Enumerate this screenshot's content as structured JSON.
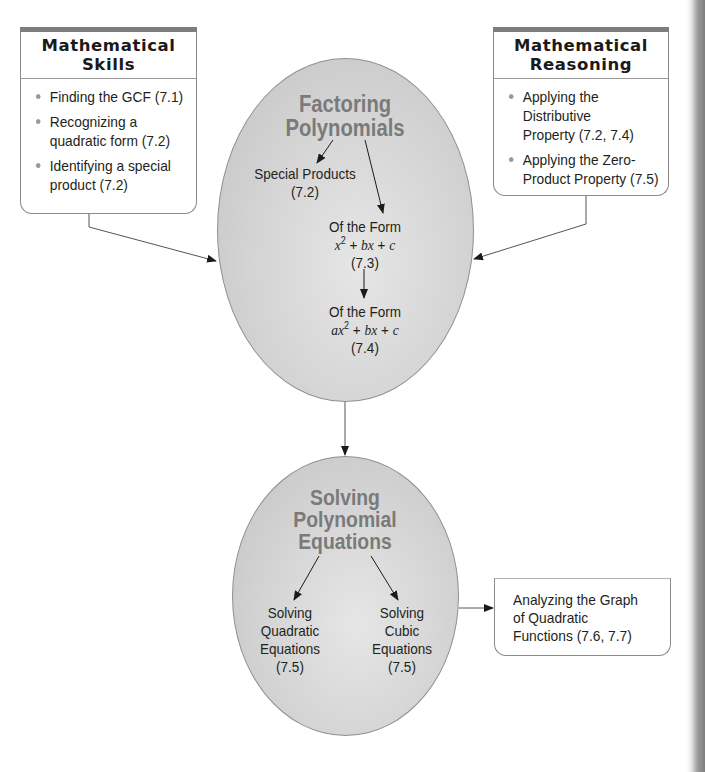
{
  "skills_box": {
    "title_line1": "Mathematical",
    "title_line2": "Skills",
    "items": [
      {
        "line1": "Finding the GCF (7.1)",
        "line2": ""
      },
      {
        "line1": "Recognizing a",
        "line2": "quadratic form (7.2)"
      },
      {
        "line1": "Identifying a special",
        "line2": "product (7.2)"
      }
    ]
  },
  "reasoning_box": {
    "title_line1": "Mathematical",
    "title_line2": "Reasoning",
    "items": [
      {
        "line1": "Applying the",
        "line2": "Distributive",
        "line3": "Property (7.2, 7.4)"
      },
      {
        "line1": "Applying the Zero-",
        "line2": "Product Property (7.5)",
        "line3": ""
      }
    ]
  },
  "factoring": {
    "title_line1": "Factoring",
    "title_line2": "Polynomials",
    "special_products": {
      "label": "Special Products",
      "section": "(7.2)"
    },
    "form1": {
      "label": "Of the Form",
      "expr_a": "x",
      "exp": "2",
      "expr_b": " + ",
      "expr_c": "bx",
      "expr_d": " + ",
      "expr_e": "c",
      "section": "(7.3)"
    },
    "form2": {
      "label": "Of the Form",
      "expr_a": "ax",
      "exp": "2",
      "expr_b": " + ",
      "expr_c": "bx",
      "expr_d": " + ",
      "expr_e": "c",
      "section": "(7.4)"
    }
  },
  "solving": {
    "title_line1": "Solving",
    "title_line2": "Polynomial",
    "title_line3": "Equations",
    "quadratic": {
      "line1": "Solving",
      "line2": "Quadratic",
      "line3": "Equations",
      "section": "(7.5)"
    },
    "cubic": {
      "line1": "Solving",
      "line2": "Cubic",
      "line3": "Equations",
      "section": "(7.5)"
    }
  },
  "graph_box": {
    "line1": "Analyzing the Graph",
    "line2": "of Quadratic",
    "line3": "Functions (7.6, 7.7)"
  },
  "colors": {
    "ellipse_fill": "#d3d3d3",
    "ellipse_title": "#7a7a7a",
    "box_border": "#8a8a8a",
    "box_topbar": "#7d7d7d",
    "text": "#231f20"
  }
}
